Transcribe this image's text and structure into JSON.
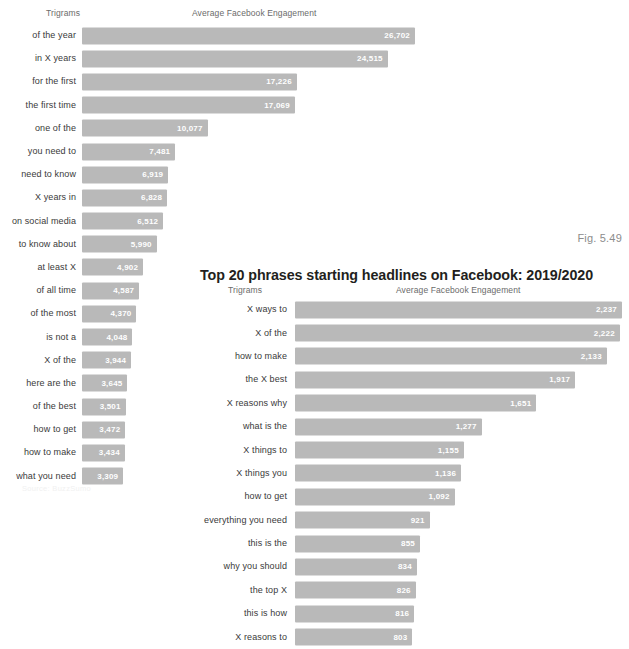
{
  "figure_number": "Fig. 5.49",
  "source_note": "Source: BuzzSumo",
  "left_chart": {
    "axis_labels": {
      "category": "Trigrams",
      "value": "Average Facebook Engagement"
    }
  },
  "right_chart": {
    "title": "Top 20 phrases starting headlines on Facebook: 2019/2020",
    "axis_labels": {
      "category": "Trigrams",
      "value": "Average Facebook Engagement"
    }
  },
  "chart_data": [
    {
      "type": "bar",
      "orientation": "horizontal",
      "title": "",
      "xlabel": "Average Facebook Engagement",
      "ylabel": "Trigrams",
      "grid": false,
      "legend": "none",
      "xlim": [
        0,
        26702
      ],
      "categories": [
        "of the year",
        "in X years",
        "for the first",
        "the first time",
        "one of the",
        "you need to",
        "need to know",
        "X years in",
        "on social media",
        "to know about",
        "at least X",
        "of all time",
        "of the most",
        "is not a",
        "X of the",
        "here are the",
        "of the best",
        "how to get",
        "how to make",
        "what you need"
      ],
      "values": [
        26702,
        24515,
        17226,
        17069,
        10077,
        7481,
        6919,
        6828,
        6512,
        5990,
        4902,
        4587,
        4370,
        4048,
        3944,
        3645,
        3501,
        3472,
        3434,
        3309
      ],
      "value_labels": [
        "26,702",
        "24,515",
        "17,226",
        "17,069",
        "10,077",
        "7,481",
        "6,919",
        "6,828",
        "6,512",
        "5,990",
        "4,902",
        "4,587",
        "4,370",
        "4,048",
        "3,944",
        "3,645",
        "3,501",
        "3,472",
        "3,434",
        "3,309"
      ]
    },
    {
      "type": "bar",
      "orientation": "horizontal",
      "title": "Top 20 phrases starting headlines on Facebook: 2019/2020",
      "xlabel": "Average Facebook Engagement",
      "ylabel": "Trigrams",
      "grid": false,
      "legend": "none",
      "xlim": [
        0,
        2237
      ],
      "categories": [
        "X ways to",
        "X of the",
        "how to make",
        "the X best",
        "X reasons why",
        "what is the",
        "X things to",
        "X things you",
        "how to get",
        "everything you need",
        "this is the",
        "why you should",
        "the top X",
        "this is how",
        "X reasons to"
      ],
      "values": [
        2237,
        2222,
        2133,
        1917,
        1651,
        1277,
        1155,
        1136,
        1092,
        921,
        855,
        834,
        826,
        816,
        803
      ],
      "value_labels": [
        "2,237",
        "2,222",
        "2,133",
        "1,917",
        "1,651",
        "1,277",
        "1,155",
        "1,136",
        "1,092",
        "921",
        "855",
        "834",
        "826",
        "816",
        "803"
      ]
    }
  ],
  "colors": {
    "bar": "#b9b9b9",
    "bar_value_text": "#ffffff",
    "label_text": "#3a3a3a",
    "axis_label_text": "#6b6b6b",
    "title_text": "#231f20",
    "fig_number_text": "#8c8c8c",
    "background": "#ffffff"
  }
}
